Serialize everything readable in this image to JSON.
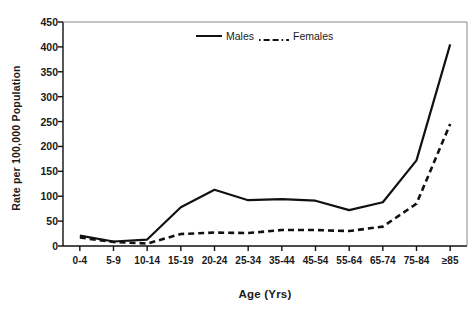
{
  "chart_data": {
    "type": "line",
    "title": "",
    "xlabel": "Age (Yrs)",
    "ylabel": "Rate per 100,000 Population",
    "categories": [
      "0-4",
      "5-9",
      "10-14",
      "15-19",
      "20-24",
      "25-34",
      "35-44",
      "45-54",
      "55-64",
      "65-74",
      "75-84",
      "≥85"
    ],
    "ylim": [
      0,
      450
    ],
    "yticks": [
      0,
      50,
      100,
      150,
      200,
      250,
      300,
      350,
      400,
      450
    ],
    "grid": false,
    "legend_position": "top-center",
    "series": [
      {
        "name": "Males",
        "style": "solid",
        "color": "#111111",
        "values": [
          21,
          9,
          13,
          78,
          113,
          92,
          94,
          91,
          72,
          88,
          172,
          405
        ]
      },
      {
        "name": "Females",
        "style": "dashed",
        "color": "#111111",
        "values": [
          17,
          8,
          5,
          24,
          27,
          26,
          32,
          32,
          30,
          39,
          85,
          245
        ]
      }
    ]
  },
  "axes": {
    "ylabel": "Rate per 100,000 Population",
    "xlabel": "Age (Yrs)",
    "ytick_labels": [
      "450",
      "400",
      "350",
      "300",
      "250",
      "200",
      "150",
      "100",
      "50",
      "0"
    ],
    "xtick_labels": [
      "0-4",
      "5-9",
      "10-14",
      "15-19",
      "20-24",
      "25-34",
      "35-44",
      "45-54",
      "55-64",
      "65-74",
      "75-84",
      "≥85"
    ]
  },
  "legend": {
    "males_label": "Males",
    "females_label": "Females"
  },
  "colors": {
    "line": "#111111",
    "axis": "#111111",
    "background": "#ffffff"
  }
}
